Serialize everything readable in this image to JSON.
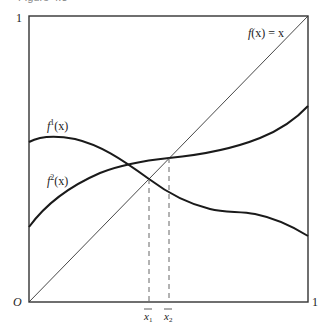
{
  "caption": "Figure 4.3",
  "axes": {
    "origin_label": "O",
    "x_max_label": "1",
    "y_max_label": "1"
  },
  "curves": {
    "identity": {
      "label_f": "f",
      "label_rest": "(x) = x"
    },
    "f1": {
      "label_f": "f",
      "label_sup": "1",
      "label_rest": "(x)"
    },
    "f2": {
      "label_f": "f",
      "label_sup": "2",
      "label_rest": "(x)"
    }
  },
  "fixed_points": {
    "x1": {
      "label": "x",
      "sub": "1"
    },
    "x2": {
      "label": "x",
      "sub": "2"
    }
  },
  "colors": {
    "frame": "#333333",
    "curve": "#1a1a1a",
    "dashed": "#555555"
  }
}
